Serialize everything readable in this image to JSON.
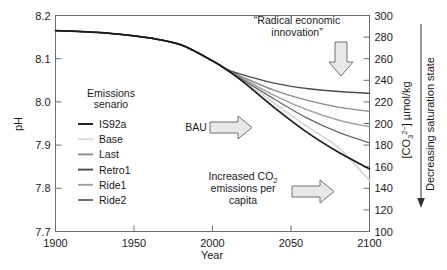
{
  "chart_data": {
    "type": "line",
    "title": "",
    "xlabel": "Year",
    "ylabel": "pH",
    "y2label": "[CO3 2-] µmol/kg",
    "xlim": [
      1900,
      2100
    ],
    "ylim": [
      7.7,
      8.2
    ],
    "y2lim": [
      100,
      300
    ],
    "grid": false,
    "legend_position": "inside-left",
    "xticks": [
      "1900",
      "1950",
      "2000",
      "2050",
      "2100"
    ],
    "xtick_values": [
      1900,
      1950,
      2000,
      2050,
      2100
    ],
    "yticks": [
      "7.7",
      "7.8",
      "7.9",
      "8.0",
      "8.1",
      "8.2"
    ],
    "ytick_values": [
      7.7,
      7.8,
      7.9,
      8.0,
      8.1,
      8.2
    ],
    "y2ticks": [
      "100",
      "120",
      "140",
      "160",
      "180",
      "200",
      "220",
      "240",
      "260",
      "280",
      "300"
    ],
    "y2tick_values": [
      100,
      120,
      140,
      160,
      180,
      200,
      220,
      240,
      260,
      280,
      300
    ],
    "legend_heading_line1": "Emissions",
    "legend_heading_line2": "senario",
    "x": [
      1900,
      1920,
      1940,
      1960,
      1980,
      2000,
      2010,
      2020,
      2040,
      2060,
      2080,
      2100
    ],
    "series": [
      {
        "name": "IS92a",
        "color": "#1a1a1a",
        "width": 1.7,
        "values": [
          8.165,
          8.162,
          8.157,
          8.148,
          8.132,
          8.095,
          8.072,
          8.045,
          7.985,
          7.93,
          7.884,
          7.845
        ]
      },
      {
        "name": "Base",
        "color": "#d8d8d8",
        "width": 1.7,
        "values": [
          8.165,
          8.162,
          8.157,
          8.148,
          8.132,
          8.095,
          8.072,
          8.048,
          7.995,
          7.944,
          7.895,
          7.818
        ]
      },
      {
        "name": "Last",
        "color": "#8c8c8c",
        "width": 1.4,
        "values": [
          8.165,
          8.162,
          8.157,
          8.148,
          8.132,
          8.095,
          8.073,
          8.056,
          8.026,
          8.004,
          7.988,
          7.978
        ]
      },
      {
        "name": "Retro1",
        "color": "#4d4d4d",
        "width": 1.4,
        "values": [
          8.165,
          8.162,
          8.157,
          8.148,
          8.132,
          8.095,
          8.074,
          8.062,
          8.043,
          8.031,
          8.024,
          8.02
        ]
      },
      {
        "name": "Ride1",
        "color": "#9e9e9e",
        "width": 1.4,
        "values": [
          8.165,
          8.162,
          8.157,
          8.148,
          8.132,
          8.095,
          8.073,
          8.053,
          8.014,
          7.982,
          7.958,
          7.942
        ]
      },
      {
        "name": "Ride2",
        "color": "#6b6b6b",
        "width": 1.4,
        "values": [
          8.165,
          8.162,
          8.157,
          8.148,
          8.132,
          8.095,
          8.072,
          8.05,
          8.005,
          7.963,
          7.93,
          7.905
        ]
      }
    ],
    "annotations": [
      {
        "id": "radical-economic-innovation",
        "line1": "“Radical economic",
        "line2": "innovation”",
        "arrow": "down"
      },
      {
        "id": "bau",
        "line1": "BAU",
        "arrow": "right"
      },
      {
        "id": "increased-co2-emissions",
        "line1": "Increased CO2",
        "line2": "emissions per",
        "line3": "capita",
        "arrow": "right"
      },
      {
        "id": "decreasing-saturation-state",
        "line1": "Decreasing saturation state",
        "arrow": "down"
      }
    ]
  },
  "axes": {
    "x_title": "Year",
    "y_title": "pH",
    "y2_title_prefix": "[CO",
    "y2_title_sub": "3",
    "y2_title_sup": "2−",
    "y2_title_suffix": "] µmol/kg",
    "saturation_note": "Decreasing saturation state"
  },
  "legend": {
    "heading_line1": "Emissions",
    "heading_line2": "senario",
    "items": [
      {
        "label": "IS92a",
        "color": "#1a1a1a"
      },
      {
        "label": "Base",
        "color": "#d8d8d8"
      },
      {
        "label": "Last",
        "color": "#8c8c8c"
      },
      {
        "label": "Retro1",
        "color": "#4d4d4d"
      },
      {
        "label": "Ride1",
        "color": "#9e9e9e"
      },
      {
        "label": "Ride2",
        "color": "#6b6b6b"
      }
    ]
  },
  "annotation_text": {
    "radical_line1": "“Radical economic",
    "radical_line2": "innovation”",
    "bau": "BAU",
    "increased_line1_a": "Increased CO",
    "increased_line1_sub": "2",
    "increased_line2": "emissions per",
    "increased_line3": "capita"
  },
  "ticks": {
    "x": [
      "1900",
      "1950",
      "2000",
      "2050",
      "2100"
    ],
    "y": [
      "8.2",
      "8.1",
      "8.0",
      "7.9",
      "7.8",
      "7.7"
    ],
    "y2": [
      "300",
      "280",
      "260",
      "240",
      "220",
      "200",
      "180",
      "160",
      "140",
      "120",
      "100"
    ]
  },
  "colors": {
    "frame": "#6e6e6e",
    "text": "#1a1a1a",
    "arrow_fill": "#e8e8e8",
    "arrow_stroke": "#707070",
    "background": "#ffffff"
  }
}
